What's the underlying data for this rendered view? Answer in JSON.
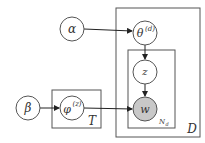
{
  "diagram": {
    "type": "plate-notation",
    "nodes": {
      "alpha": {
        "label": "α"
      },
      "beta": {
        "label": "β"
      },
      "theta": {
        "label": "θ",
        "superscript": "(d)"
      },
      "phi": {
        "label": "φ",
        "superscript": "(z)"
      },
      "z": {
        "label": "z"
      },
      "w": {
        "label": "w",
        "observed": true
      }
    },
    "plates": {
      "D": {
        "label": "D"
      },
      "N": {
        "label": "N",
        "subscript": "d"
      },
      "T": {
        "label": "T"
      }
    },
    "edges": [
      {
        "from": "alpha",
        "to": "theta"
      },
      {
        "from": "theta",
        "to": "z"
      },
      {
        "from": "z",
        "to": "w"
      },
      {
        "from": "beta",
        "to": "phi"
      },
      {
        "from": "phi",
        "to": "w"
      }
    ],
    "colors": {
      "observed_fill": "#c8c8c8",
      "stroke": "#555555"
    }
  }
}
